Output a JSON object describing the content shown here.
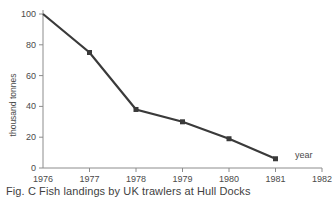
{
  "chart_data": {
    "type": "line",
    "title": "",
    "caption": "Fig. C  Fish landings by UK trawlers at Hull Docks",
    "figure_label": "Fig. C",
    "xlabel": "year",
    "ylabel": "thousand tonnes",
    "x": [
      1976,
      1977,
      1978,
      1979,
      1980,
      1981
    ],
    "values": [
      100,
      75,
      38,
      30,
      19,
      6
    ],
    "categories": [
      "1976",
      "1977",
      "1978",
      "1979",
      "1980",
      "1981"
    ],
    "xtick_labels": [
      "1976",
      "1977",
      "1978",
      "1979",
      "1980",
      "1981",
      "1982"
    ],
    "xtick_values": [
      1976,
      1977,
      1978,
      1979,
      1980,
      1981,
      1982
    ],
    "ytick_labels": [
      "0",
      "20",
      "40",
      "60",
      "80",
      "100"
    ],
    "ytick_values": [
      0,
      20,
      40,
      60,
      80,
      100
    ],
    "xlim": [
      1976,
      1982
    ],
    "ylim": [
      0,
      100
    ],
    "grid": false,
    "legend": false,
    "marker": "square",
    "line_color": "#3a3a3a",
    "axis_color": "#8c8c8c",
    "text_color": "#4a4a4a",
    "background_color": "#ffffff"
  }
}
